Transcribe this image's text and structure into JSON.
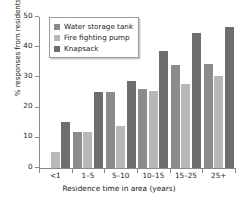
{
  "chart_data": {
    "type": "bar",
    "title": "",
    "xlabel": "Residence time in area (years)",
    "ylabel": "% responses from residents",
    "categories": [
      "<1",
      "1–5",
      "5–10",
      "10–15",
      "15–25",
      "25+"
    ],
    "series": [
      {
        "name": "Water storage tank",
        "color": "#8c8c8c",
        "values": [
          0,
          12,
          25.3,
          26.3,
          34.2,
          34.5
        ]
      },
      {
        "name": "Fire fighting pump",
        "color": "#b8b8b8",
        "values": [
          5.3,
          12,
          13.9,
          25.5,
          27.9,
          30.4
        ]
      },
      {
        "name": "Knapsack",
        "color": "#6e6e6e",
        "values": [
          15.2,
          25.2,
          28.8,
          38.8,
          44.8,
          46.6
        ]
      }
    ],
    "ylim": [
      0,
      50
    ],
    "yticks": [
      0,
      10,
      20,
      30,
      40,
      50
    ],
    "ytick_labels": [
      "0",
      "10",
      "20",
      "30",
      "40",
      "50"
    ],
    "grid": false,
    "legend_position": "top-left"
  },
  "legend": {
    "items": [
      {
        "label": "Water storage tank"
      },
      {
        "label": "Fire fighting pump"
      },
      {
        "label": "Knapsack"
      }
    ]
  }
}
